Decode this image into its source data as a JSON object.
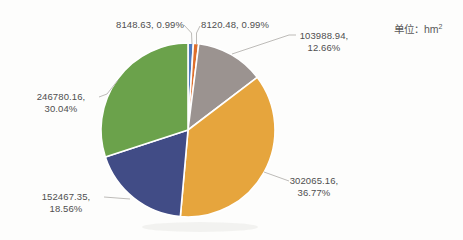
{
  "chart_data": {
    "type": "pie",
    "title": "",
    "unit_prefix": "单位：hm",
    "unit_sup": "2",
    "unit": "hm²",
    "legend": "none",
    "start_angle_deg": 0,
    "direction": "clockwise",
    "slices": [
      {
        "value": 8148.63,
        "pct": 0.99,
        "color": "#4c79be",
        "label_line1": "8148.63, 0.99%",
        "label_line2": ""
      },
      {
        "value": 8120.48,
        "pct": 0.99,
        "color": "#de6f2c",
        "label_line1": "8120.48, 0.99%",
        "label_line2": ""
      },
      {
        "value": 103988.94,
        "pct": 12.66,
        "color": "#9b9390",
        "label_line1": "103988.94,",
        "label_line2": "12.66%"
      },
      {
        "value": 302065.16,
        "pct": 36.77,
        "color": "#e6a53d",
        "label_line1": "302065.16,",
        "label_line2": "36.77%"
      },
      {
        "value": 152467.35,
        "pct": 18.56,
        "color": "#414c86",
        "label_line1": "152467.35,",
        "label_line2": "18.56%"
      },
      {
        "value": 246780.16,
        "pct": 30.04,
        "color": "#6ba24b",
        "label_line1": "246780.16,",
        "label_line2": "30.04%"
      }
    ]
  }
}
